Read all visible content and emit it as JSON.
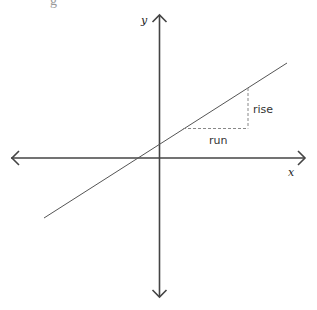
{
  "diagram": {
    "title_fragment": "g",
    "axes": {
      "x_label": "x",
      "y_label": "y"
    },
    "annotations": {
      "rise_label": "rise",
      "run_label": "run"
    },
    "colors": {
      "axis": "#444444",
      "line": "#555555",
      "dashed": "#888888",
      "background": "#ffffff"
    }
  }
}
